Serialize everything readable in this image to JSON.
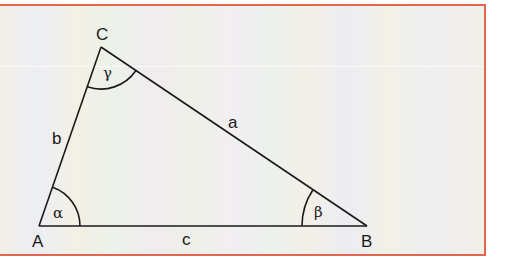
{
  "diagram": {
    "type": "triangle",
    "vertices": [
      {
        "name": "A",
        "x": 39,
        "y": 226
      },
      {
        "name": "B",
        "x": 367,
        "y": 226
      },
      {
        "name": "C",
        "x": 101,
        "y": 47
      }
    ],
    "sides": [
      {
        "name": "a",
        "from": "B",
        "to": "C"
      },
      {
        "name": "b",
        "from": "A",
        "to": "C"
      },
      {
        "name": "c",
        "from": "A",
        "to": "B"
      }
    ],
    "angles": [
      {
        "name": "alpha",
        "symbol": "α",
        "vertex": "A"
      },
      {
        "name": "beta",
        "symbol": "β",
        "vertex": "B"
      },
      {
        "name": "gamma",
        "symbol": "γ",
        "vertex": "C"
      }
    ],
    "colors": {
      "border": "#e2674f",
      "line": "#1a1a1a"
    }
  },
  "labels": {
    "A": "A",
    "B": "B",
    "C": "C",
    "a": "a",
    "b": "b",
    "c": "c",
    "alpha": "α",
    "beta": "β",
    "gamma": "γ"
  }
}
